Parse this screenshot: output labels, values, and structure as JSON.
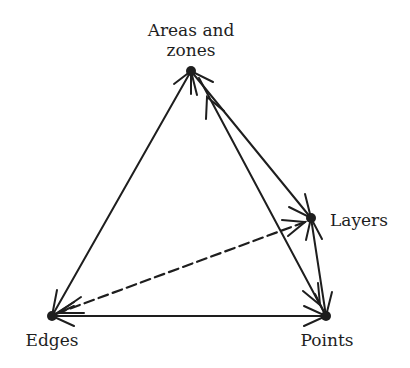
{
  "diagram": {
    "colors": {
      "line": "#1e1e1e",
      "background": "#ffffff"
    },
    "nodes": {
      "areas": {
        "label_line1": "Areas and",
        "label_line2": "zones",
        "x": 191,
        "y": 71
      },
      "layers": {
        "label": "Layers",
        "x": 311,
        "y": 218
      },
      "edges": {
        "label": "Edges",
        "x": 52,
        "y": 316
      },
      "points": {
        "label": "Points",
        "x": 326,
        "y": 316
      }
    },
    "connections": [
      {
        "from": "Areas and zones",
        "to": "Edges",
        "style": "solid",
        "arrows": "end"
      },
      {
        "from": "Edges",
        "to": "Points",
        "style": "solid",
        "arrows": "both"
      },
      {
        "from": "Areas and zones",
        "to": "Layers",
        "style": "solid",
        "arrows": "both"
      },
      {
        "from": "Areas and zones",
        "to": "Points",
        "style": "solid",
        "arrows": "both"
      },
      {
        "from": "Layers",
        "to": "Points",
        "style": "solid",
        "arrows": "both"
      },
      {
        "from": "Layers",
        "to": "Edges",
        "style": "dashed",
        "arrows": "both"
      }
    ]
  }
}
